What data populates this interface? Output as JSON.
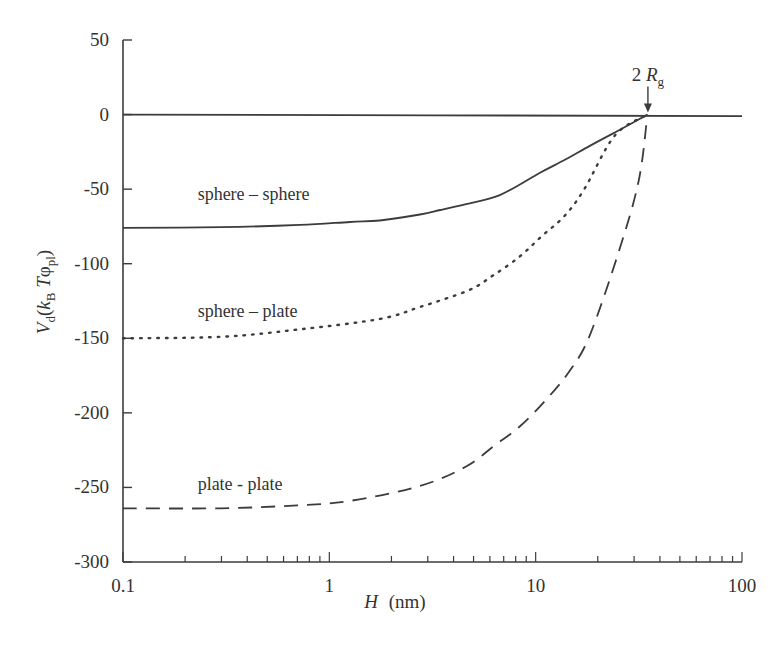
{
  "chart_data": {
    "type": "line",
    "title": "",
    "xlabel": "H (nm)",
    "xlabel_var": "H",
    "xlabel_unit": "(nm)",
    "ylabel": "V_d(k_B T φ_pl)",
    "xscale": "log",
    "xlim": [
      0.1,
      100
    ],
    "ylim": [
      -300,
      50
    ],
    "xticks": [
      0.1,
      1,
      10,
      100
    ],
    "xtick_labels": [
      "0.1",
      "1",
      "10",
      "100"
    ],
    "yticks": [
      50,
      0,
      -50,
      -100,
      -150,
      -200,
      -250,
      -300
    ],
    "ytick_labels": [
      "50",
      "0",
      "-50",
      "-100",
      "-150",
      "-200",
      "-250",
      "-300"
    ],
    "grid": false,
    "legend": "inline labels",
    "annotation": {
      "text_main": "2 R",
      "text_sub": "g",
      "x": 35,
      "y": 0,
      "arrow": "down"
    },
    "series": [
      {
        "name": "zero-line",
        "label": "",
        "style": "solid",
        "x": [
          0.1,
          100
        ],
        "y": [
          0,
          -1
        ]
      },
      {
        "name": "sphere-sphere",
        "label": "sphere – sphere",
        "style": "solid",
        "x": [
          0.1,
          0.3,
          0.72,
          1.26,
          1.76,
          2.75,
          3.45,
          4.6,
          6.7,
          10.5,
          14,
          18.3,
          24.2,
          30,
          34.8
        ],
        "y": [
          -76,
          -75.5,
          -74,
          -72,
          -71,
          -67,
          -64,
          -60,
          -54,
          -39,
          -30,
          -21,
          -12,
          -5,
          0
        ]
      },
      {
        "name": "sphere-plate",
        "label": "sphere – plate",
        "style": "dotted",
        "x": [
          0.1,
          0.3,
          0.72,
          1.76,
          2.75,
          4.7,
          6.2,
          8.4,
          10.8,
          13.8,
          17.2,
          24.2,
          34.8
        ],
        "y": [
          -150,
          -149,
          -144,
          -137,
          -129,
          -118,
          -108,
          -95,
          -81,
          -68,
          -50,
          -14,
          0
        ]
      },
      {
        "name": "plate-plate",
        "label": "plate - plate",
        "style": "dashed",
        "x": [
          0.1,
          0.3,
          0.7,
          1.26,
          2.75,
          4.6,
          6.3,
          8.4,
          11.1,
          14.6,
          18.3,
          25.4,
          31.6,
          34.8
        ],
        "y": [
          -264,
          -264,
          -262,
          -259,
          -249,
          -236,
          -222,
          -209,
          -192,
          -172,
          -148,
          -91,
          -44,
          0
        ]
      }
    ],
    "label_positions": {
      "sphere-sphere": {
        "x": 0.23,
        "y": -57
      },
      "sphere-plate": {
        "x": 0.23,
        "y": -136
      },
      "plate-plate": {
        "x": 0.23,
        "y": -252
      }
    }
  },
  "layout": {
    "plot_left": 123,
    "plot_right": 742,
    "plot_top": 40,
    "plot_bottom": 562,
    "colors": {
      "line": "#3c3c3c",
      "text": "#333333",
      "background": "#ffffff"
    }
  }
}
